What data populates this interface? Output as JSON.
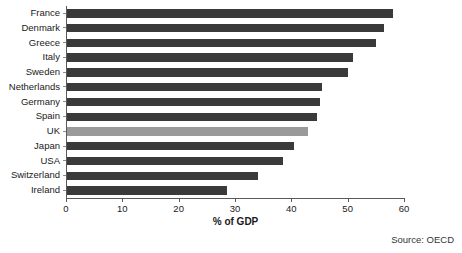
{
  "chart_data": {
    "type": "bar",
    "orientation": "horizontal",
    "title": "",
    "xlabel": "% of GDP",
    "ylabel": "",
    "xlim": [
      0,
      60
    ],
    "xticks": [
      0,
      10,
      20,
      30,
      40,
      50,
      60
    ],
    "grid": false,
    "legend": null,
    "categories": [
      "France",
      "Denmark",
      "Greece",
      "Italy",
      "Sweden",
      "Netherlands",
      "Germany",
      "Spain",
      "UK",
      "Japan",
      "USA",
      "Switzerland",
      "Ireland"
    ],
    "values": [
      58,
      56.5,
      55,
      51,
      50,
      45.5,
      45,
      44.5,
      43,
      40.5,
      38.5,
      34,
      28.5
    ],
    "highlight_category": "UK",
    "colors": {
      "bar": "#3a3a3a",
      "bar_highlight": "#9a9a9a",
      "axis": "#5a5a5a",
      "text": "#1a1a1a"
    },
    "annotations": [
      {
        "name": "source",
        "text": "Source: OECD"
      }
    ]
  },
  "source": {
    "text": "Source: OECD"
  }
}
